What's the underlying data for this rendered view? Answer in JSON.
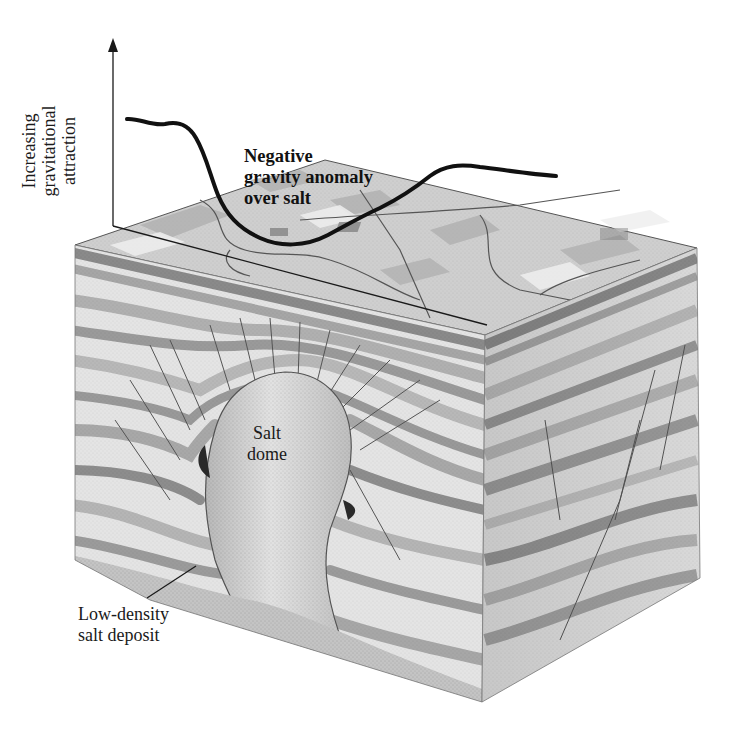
{
  "figure": {
    "type": "block-diagram",
    "colors": {
      "background": "#ffffff",
      "ink": "#1a1a1a",
      "gravity_curve": "#111111",
      "strata_light": "#e6e6e6",
      "strata_mid": "#bdbdbd",
      "strata_dark": "#8f8f8f",
      "salt": "#cfcfcf",
      "surface": "#c8c8c8"
    }
  },
  "graph": {
    "y_axis_label": [
      "Increasing",
      "gravitational",
      "attraction"
    ],
    "curve_label": [
      "Negative",
      "gravity anomaly",
      "over salt"
    ]
  },
  "labels": {
    "salt_dome": [
      "Salt",
      "dome"
    ],
    "salt_deposit": [
      "Low-density",
      "salt deposit"
    ]
  }
}
